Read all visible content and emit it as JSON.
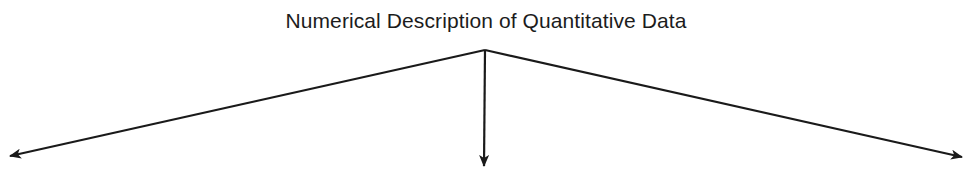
{
  "diagram": {
    "title": "Numerical Description of Quantitative Data",
    "stroke_color": "#1a1a1a",
    "apex": {
      "x": 485,
      "y": 50
    },
    "arrows": [
      {
        "name": "left-branch",
        "to": {
          "x": 10,
          "y": 156
        }
      },
      {
        "name": "center-branch",
        "to": {
          "x": 484,
          "y": 166
        }
      },
      {
        "name": "right-branch",
        "to": {
          "x": 962,
          "y": 157
        }
      }
    ]
  }
}
